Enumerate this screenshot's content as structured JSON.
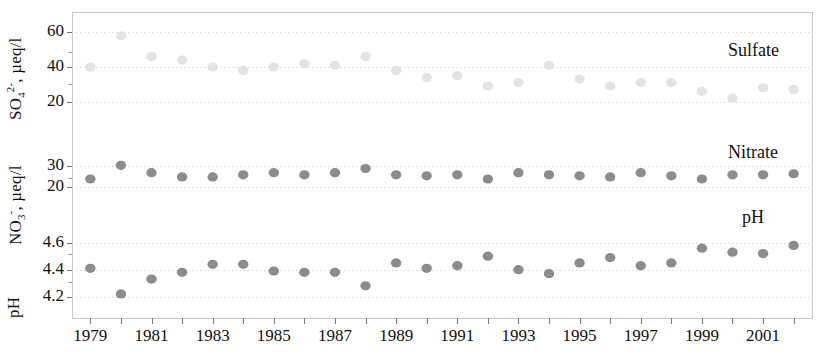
{
  "chart_data": {
    "type": "scatter",
    "title": "",
    "xlabel": "",
    "x": [
      1979,
      1980,
      1981,
      1982,
      1983,
      1984,
      1985,
      1986,
      1987,
      1988,
      1989,
      1990,
      1991,
      1992,
      1993,
      1994,
      1995,
      1996,
      1997,
      1998,
      1999,
      2000,
      2001,
      2002
    ],
    "xlim": [
      1978.4,
      2002.6
    ],
    "xticks": [
      1979,
      1980,
      1981,
      1982,
      1983,
      1984,
      1985,
      1986,
      1987,
      1988,
      1989,
      1990,
      1991,
      1992,
      1993,
      1994,
      1995,
      1996,
      1997,
      1998,
      1999,
      2000,
      2001,
      2002
    ],
    "xticklabels": [
      "1979",
      "",
      "1981",
      "",
      "1983",
      "",
      "1985",
      "",
      "1987",
      "",
      "1989",
      "",
      "1991",
      "",
      "1993",
      "",
      "1995",
      "",
      "1997",
      "",
      "1999",
      "",
      "2001",
      ""
    ],
    "grid": true,
    "legend_position": "inside-right",
    "panels": [
      {
        "name": "sulfate",
        "label": "Sulfate",
        "ylabel": "SO4 2-, µeq/l",
        "ylabel_html": "SO<sub>4</sub><sup>2-</sup>, µeq/l",
        "color": "#e3e3e3",
        "ylim": [
          14,
          66
        ],
        "yticks": [
          20,
          40,
          60
        ],
        "yticklabels": [
          "20",
          "40",
          "60"
        ],
        "values": [
          40,
          58,
          46,
          44,
          40,
          38,
          40,
          42,
          41,
          46,
          38,
          34,
          35,
          29,
          31,
          41,
          33,
          29,
          31,
          31,
          26,
          22,
          28,
          27
        ]
      },
      {
        "name": "nitrate",
        "label": "Nitrate",
        "ylabel": "NO3 -, µeq/l",
        "ylabel_html": "NO<sub>3</sub><sup>-</sup>, µeq/l",
        "color": "#8c8c8c",
        "ylim": [
          14,
          34
        ],
        "yticks": [
          20,
          30
        ],
        "yticklabels": [
          "20",
          "30"
        ],
        "values": [
          24,
          30.5,
          27,
          25,
          25,
          26,
          27,
          26,
          27,
          29,
          26,
          25.5,
          26,
          24,
          27,
          26,
          25.5,
          25,
          27,
          25.5,
          24,
          26,
          26,
          26.5
        ]
      },
      {
        "name": "ph",
        "label": "pH",
        "ylabel": "pH",
        "ylabel_html": "pH",
        "color": "#8c8c8c",
        "ylim": [
          4.13,
          4.68
        ],
        "yticks": [
          4.2,
          4.4,
          4.6
        ],
        "yticklabels": [
          "4.2",
          "4.4",
          "4.6"
        ],
        "values": [
          4.41,
          4.22,
          4.33,
          4.38,
          4.44,
          4.44,
          4.39,
          4.38,
          4.38,
          4.28,
          4.45,
          4.41,
          4.43,
          4.5,
          4.4,
          4.37,
          4.45,
          4.49,
          4.43,
          4.45,
          4.56,
          4.53,
          4.52,
          4.58
        ]
      }
    ]
  },
  "axis_titles": {
    "sulfate": "SO4 2-, µeq/l",
    "nitrate": "NO3 -, µeq/l",
    "ph": "pH"
  }
}
